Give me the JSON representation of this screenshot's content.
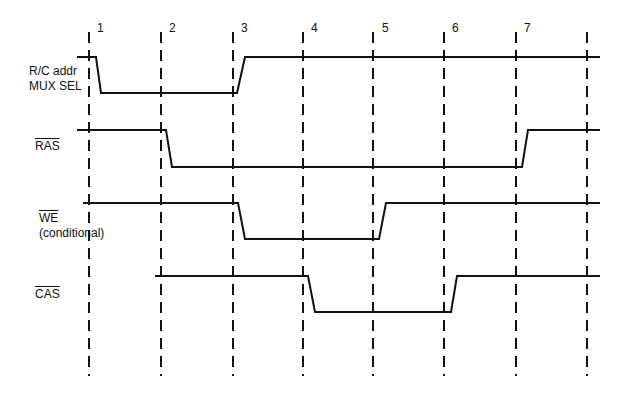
{
  "diagram": {
    "type": "timing-diagram",
    "colors": {
      "line": "#111111",
      "background": "#ffffff"
    },
    "time_markers": [
      {
        "label": "1",
        "x": 89
      },
      {
        "label": "2",
        "x": 161
      },
      {
        "label": "3",
        "x": 233
      },
      {
        "label": "4",
        "x": 303
      },
      {
        "label": "5",
        "x": 373
      },
      {
        "label": "6",
        "x": 444
      },
      {
        "label": "7",
        "x": 516
      },
      {
        "label": "",
        "x": 587
      }
    ],
    "signals": [
      {
        "name": "R/C addr MUX SEL",
        "label_line1": "R/C addr",
        "label_line2": "MUX SEL",
        "active_low": false,
        "start": "high",
        "transitions": [
          "fall after 1",
          "rise after 3"
        ]
      },
      {
        "name": "RAS",
        "label_line1": "RAS",
        "active_low": true,
        "start": "high",
        "transitions": [
          "fall after 2",
          "rise after 7"
        ]
      },
      {
        "name": "WE",
        "label_line1": "WE",
        "label_line2": "(conditional)",
        "active_low": true,
        "start": "high",
        "transitions": [
          "fall after 3",
          "rise after 5"
        ]
      },
      {
        "name": "CAS",
        "label_line1": "CAS",
        "active_low": true,
        "start": "high (from marker 2)",
        "transitions": [
          "fall after 4",
          "rise after 6"
        ]
      }
    ]
  }
}
